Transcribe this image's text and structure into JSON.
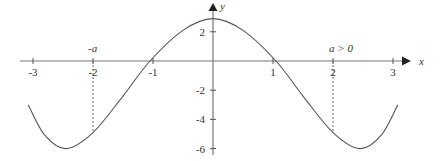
{
  "chart_data": {
    "type": "line",
    "title": "",
    "xlabel": "x",
    "ylabel": "y",
    "xlim": [
      -3.25,
      3.15
    ],
    "ylim": [
      -6.3,
      3.2
    ],
    "x_ticks": [
      -3,
      -2,
      -1,
      1,
      2,
      3
    ],
    "x_tick_labels": [
      "-3",
      "-2",
      "-1",
      "1",
      "2",
      "3"
    ],
    "y_ticks": [
      2,
      -2,
      -4,
      -6
    ],
    "y_tick_labels": [
      "2",
      "-2",
      "-4",
      "-6"
    ],
    "grid": false,
    "legend": null,
    "annotations": [
      {
        "text": "-a",
        "x": -2,
        "position": "above x-axis"
      },
      {
        "text": "a > 0",
        "x": 2,
        "position": "above x-axis"
      }
    ],
    "dashed_guides": [
      {
        "x": -2,
        "from_y": 0,
        "to_y": -4.9
      },
      {
        "x": 2,
        "from_y": 0,
        "to_y": -4.9
      }
    ],
    "series": [
      {
        "name": "f(x)",
        "x": [
          -3.08,
          -2.8,
          -2.45,
          -2.0,
          -1.5,
          -1.05,
          -0.5,
          0,
          0.5,
          1.05,
          1.5,
          2.0,
          2.45,
          2.8,
          3.08
        ],
        "y": [
          -3.0,
          -5.1,
          -6.0,
          -4.9,
          -2.4,
          0,
          2.1,
          2.9,
          2.1,
          0,
          -2.4,
          -4.9,
          -6.0,
          -5.1,
          -3.0
        ]
      }
    ]
  },
  "axes": {
    "x_label": "x",
    "y_label": "y"
  },
  "labels": {
    "neg_a": "-a",
    "pos_a": "a > 0"
  }
}
